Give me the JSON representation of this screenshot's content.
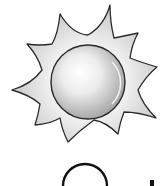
{
  "image": {
    "description": "Clip-art sun icon with spiky rays and a glossy gray center",
    "main_icon": "sun-icon",
    "partial_icon_bottom": "circle-icon",
    "colors": {
      "background": "#ffffff",
      "outline": "#2a2a2a",
      "ray_fill_light": "#fafafa",
      "ray_fill_dark": "#c8c8c8",
      "center_highlight": "#ffffff",
      "center_shade": "#a8a8a8"
    }
  }
}
